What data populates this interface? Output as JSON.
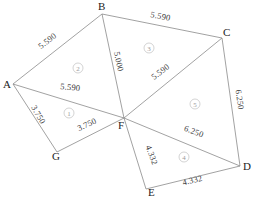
{
  "diagram": {
    "type": "geometric-subdivision",
    "vertices": [
      {
        "id": "A",
        "label": "A",
        "x": 13,
        "y": 84,
        "label_x": 3,
        "label_y": 88
      },
      {
        "id": "B",
        "label": "B",
        "x": 102,
        "y": 14,
        "label_x": 98,
        "label_y": 10
      },
      {
        "id": "C",
        "label": "C",
        "x": 222,
        "y": 38,
        "label_x": 223,
        "label_y": 36
      },
      {
        "id": "D",
        "label": "D",
        "x": 240,
        "y": 166,
        "label_x": 243,
        "label_y": 170
      },
      {
        "id": "E",
        "label": "E",
        "x": 146,
        "y": 189,
        "label_x": 148,
        "label_y": 196
      },
      {
        "id": "F",
        "label": "F",
        "x": 124,
        "y": 118,
        "label_x": 118,
        "label_y": 129
      },
      {
        "id": "G",
        "label": "G",
        "x": 57,
        "y": 152,
        "label_x": 52,
        "label_y": 160
      }
    ],
    "edges": [
      {
        "id": "AB",
        "from": "A",
        "to": "B",
        "length": "5.590",
        "label_x": 49,
        "label_y": 43,
        "rotation": -38
      },
      {
        "id": "BC",
        "from": "B",
        "to": "C",
        "length": "5.590",
        "label_x": 160,
        "label_y": 19,
        "rotation": 11
      },
      {
        "id": "CD",
        "from": "C",
        "to": "D",
        "length": "6.250",
        "label_x": 237,
        "label_y": 100,
        "rotation": 82
      },
      {
        "id": "DE",
        "from": "D",
        "to": "E",
        "length": "4.332",
        "label_x": 193,
        "label_y": 183,
        "rotation": -14
      },
      {
        "id": "EF",
        "from": "E",
        "to": "F",
        "length": "4.332",
        "label_x": 149,
        "label_y": 156,
        "rotation": 70
      },
      {
        "id": "FD",
        "from": "F",
        "to": "D",
        "length": "6.250",
        "label_x": 193,
        "label_y": 134,
        "rotation": 20
      },
      {
        "id": "FC",
        "from": "F",
        "to": "C",
        "length": "5.590",
        "label_x": 162,
        "label_y": 74,
        "rotation": -37
      },
      {
        "id": "BF",
        "from": "B",
        "to": "F",
        "length": "5.000",
        "label_x": 116,
        "label_y": 62,
        "rotation": 78
      },
      {
        "id": "AF",
        "from": "A",
        "to": "F",
        "length": "5.590",
        "label_x": 70,
        "label_y": 90,
        "rotation": 6
      },
      {
        "id": "AG",
        "from": "A",
        "to": "G",
        "length": "3.750",
        "label_x": 36,
        "label_y": 116,
        "rotation": 60
      },
      {
        "id": "GF",
        "from": "G",
        "to": "F",
        "length": "3.750",
        "label_x": 88,
        "label_y": 127,
        "rotation": -25
      }
    ],
    "regions": [
      {
        "id": "r1",
        "number": "1",
        "marker": "①",
        "triangle": "A-G-F",
        "x": 69,
        "y": 113
      },
      {
        "id": "r2",
        "number": "2",
        "marker": "②",
        "triangle": "A-B-F",
        "x": 78,
        "y": 68
      },
      {
        "id": "r3",
        "number": "3",
        "marker": "③",
        "triangle": "B-C-F",
        "x": 149,
        "y": 48
      },
      {
        "id": "r4",
        "number": "4",
        "marker": "④",
        "triangle": "F-E-D",
        "x": 184,
        "y": 157
      },
      {
        "id": "r5",
        "number": "5",
        "marker": "⑤",
        "triangle": "F-C-D",
        "x": 195,
        "y": 104
      }
    ],
    "colors": {
      "line": "#8a8a8a",
      "vertex_text": "#222222",
      "edge_text": "#3a3a3a",
      "region_text": "#9a9a9a",
      "background": "#ffffff"
    }
  }
}
